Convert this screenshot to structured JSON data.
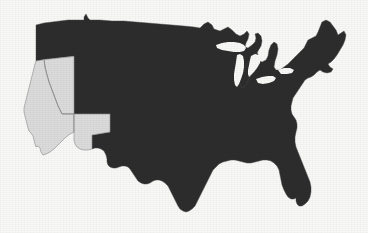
{
  "figure": {
    "width": 368,
    "height": 233,
    "background_color": "#f9f9f8"
  },
  "legend": {
    "selected_color": "#dcdcdc",
    "selected_border_color": "#8a8a8a",
    "unselected_color": "#2d2d2d",
    "unselected_border_color": "#4a4a4a",
    "lake_color": "#f9f9f8"
  },
  "chart_data": {
    "type": "map",
    "title": "",
    "subtitle": "",
    "xlabel": "",
    "ylabel": "",
    "projection": "contiguous-united-states",
    "value_field": "highlighted",
    "categories": [
      "highlighted",
      "not-highlighted"
    ],
    "legend_position": "none",
    "grid": false,
    "annotations": [],
    "selected_states": [
      "California",
      "Nevada",
      "Arizona"
    ],
    "selected_count": 3,
    "unselected_count": 45,
    "regions": [
      {
        "code": "CA",
        "name": "California",
        "highlighted": true
      },
      {
        "code": "NV",
        "name": "Nevada",
        "highlighted": true
      },
      {
        "code": "AZ",
        "name": "Arizona",
        "highlighted": true
      },
      {
        "code": "WA",
        "name": "Washington",
        "highlighted": false
      },
      {
        "code": "OR",
        "name": "Oregon",
        "highlighted": false
      },
      {
        "code": "ID",
        "name": "Idaho",
        "highlighted": false
      },
      {
        "code": "MT",
        "name": "Montana",
        "highlighted": false
      },
      {
        "code": "WY",
        "name": "Wyoming",
        "highlighted": false
      },
      {
        "code": "UT",
        "name": "Utah",
        "highlighted": false
      },
      {
        "code": "CO",
        "name": "Colorado",
        "highlighted": false
      },
      {
        "code": "NM",
        "name": "New Mexico",
        "highlighted": false
      },
      {
        "code": "ND",
        "name": "North Dakota",
        "highlighted": false
      },
      {
        "code": "SD",
        "name": "South Dakota",
        "highlighted": false
      },
      {
        "code": "NE",
        "name": "Nebraska",
        "highlighted": false
      },
      {
        "code": "KS",
        "name": "Kansas",
        "highlighted": false
      },
      {
        "code": "OK",
        "name": "Oklahoma",
        "highlighted": false
      },
      {
        "code": "TX",
        "name": "Texas",
        "highlighted": false
      },
      {
        "code": "MN",
        "name": "Minnesota",
        "highlighted": false
      },
      {
        "code": "IA",
        "name": "Iowa",
        "highlighted": false
      },
      {
        "code": "MO",
        "name": "Missouri",
        "highlighted": false
      },
      {
        "code": "AR",
        "name": "Arkansas",
        "highlighted": false
      },
      {
        "code": "LA",
        "name": "Louisiana",
        "highlighted": false
      },
      {
        "code": "WI",
        "name": "Wisconsin",
        "highlighted": false
      },
      {
        "code": "IL",
        "name": "Illinois",
        "highlighted": false
      },
      {
        "code": "MI",
        "name": "Michigan",
        "highlighted": false
      },
      {
        "code": "IN",
        "name": "Indiana",
        "highlighted": false
      },
      {
        "code": "OH",
        "name": "Ohio",
        "highlighted": false
      },
      {
        "code": "KY",
        "name": "Kentucky",
        "highlighted": false
      },
      {
        "code": "TN",
        "name": "Tennessee",
        "highlighted": false
      },
      {
        "code": "MS",
        "name": "Mississippi",
        "highlighted": false
      },
      {
        "code": "AL",
        "name": "Alabama",
        "highlighted": false
      },
      {
        "code": "GA",
        "name": "Georgia",
        "highlighted": false
      },
      {
        "code": "FL",
        "name": "Florida",
        "highlighted": false
      },
      {
        "code": "SC",
        "name": "South Carolina",
        "highlighted": false
      },
      {
        "code": "NC",
        "name": "North Carolina",
        "highlighted": false
      },
      {
        "code": "VA",
        "name": "Virginia",
        "highlighted": false
      },
      {
        "code": "WV",
        "name": "West Virginia",
        "highlighted": false
      },
      {
        "code": "MD",
        "name": "Maryland",
        "highlighted": false
      },
      {
        "code": "DE",
        "name": "Delaware",
        "highlighted": false
      },
      {
        "code": "PA",
        "name": "Pennsylvania",
        "highlighted": false
      },
      {
        "code": "NJ",
        "name": "New Jersey",
        "highlighted": false
      },
      {
        "code": "NY",
        "name": "New York",
        "highlighted": false
      },
      {
        "code": "CT",
        "name": "Connecticut",
        "highlighted": false
      },
      {
        "code": "RI",
        "name": "Rhode Island",
        "highlighted": false
      },
      {
        "code": "MA",
        "name": "Massachusetts",
        "highlighted": false
      },
      {
        "code": "VT",
        "name": "Vermont",
        "highlighted": false
      },
      {
        "code": "NH",
        "name": "New Hampshire",
        "highlighted": false
      },
      {
        "code": "ME",
        "name": "Maine",
        "highlighted": false
      }
    ]
  }
}
